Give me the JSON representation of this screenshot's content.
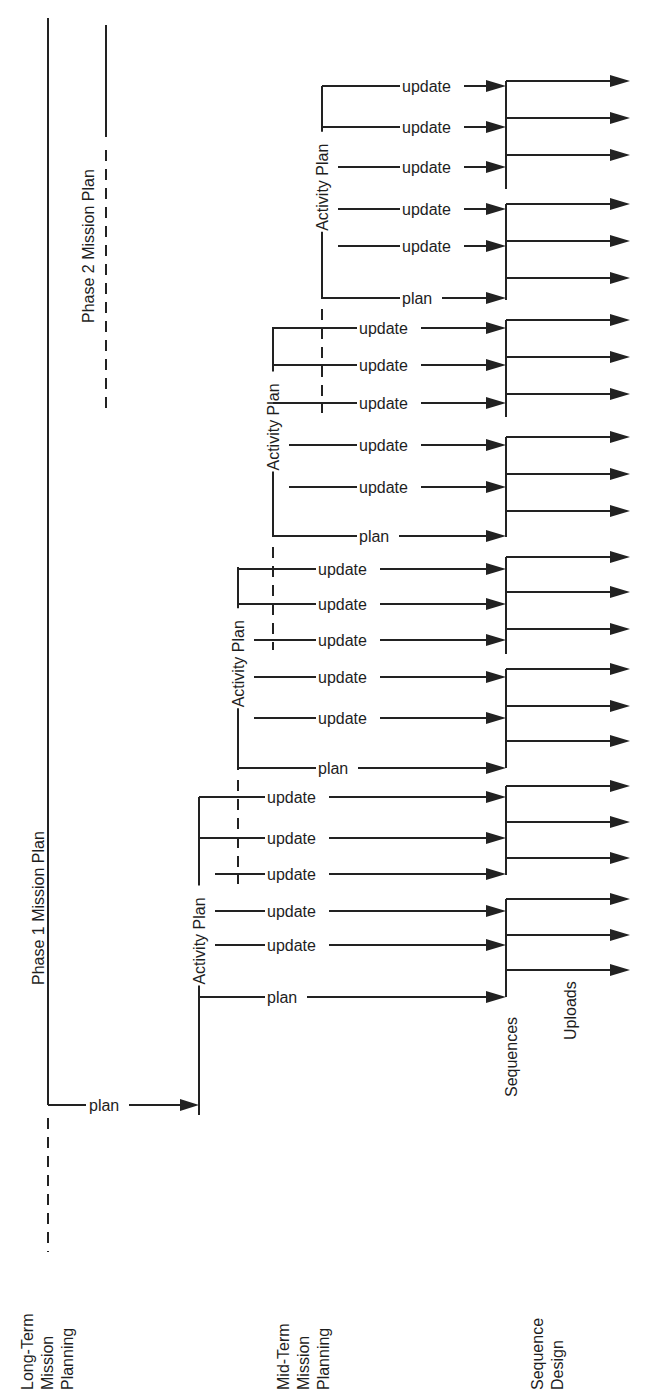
{
  "diagram": {
    "columns": [
      {
        "id": "long-term",
        "lines": [
          "Long-Term",
          "Mission",
          "Planning"
        ]
      },
      {
        "id": "mid-term",
        "lines": [
          "Mid-Term",
          "Mission",
          "Planning"
        ]
      },
      {
        "id": "sequence",
        "lines": [
          "Sequence",
          "Design"
        ]
      }
    ],
    "phase_labels": {
      "phase1": "Phase 1 Mission Plan",
      "phase2": "Phase 2 Mission Plan"
    },
    "long_term_plan_label": "plan",
    "activity_plan_label": "Activity Plan",
    "sequences_label": "Sequences",
    "uploads_label": "Uploads",
    "activity_groups": [
      {
        "x": 199,
        "top": 797,
        "bottom": 1105,
        "dash_bottom": true,
        "rows": [
          {
            "y": 797,
            "label": "update",
            "from_bracket": true
          },
          {
            "y": 838,
            "label": "update",
            "from_bracket": true
          },
          {
            "y": 874,
            "label": "update",
            "from_bracket": false
          },
          {
            "y": 911,
            "label": "update",
            "from_bracket": false
          },
          {
            "y": 945,
            "label": "update",
            "from_bracket": false
          },
          {
            "y": 997,
            "label": "plan",
            "from_bracket": true
          }
        ]
      },
      {
        "x": 238,
        "top": 567,
        "bottom": 770,
        "rows": [
          {
            "y": 569,
            "label": "update",
            "from_bracket": true
          },
          {
            "y": 604,
            "label": "update",
            "from_bracket": true
          },
          {
            "y": 640,
            "label": "update",
            "from_bracket": false
          },
          {
            "y": 677,
            "label": "update",
            "from_bracket": false
          },
          {
            "y": 718,
            "label": "update",
            "from_bracket": false
          },
          {
            "y": 768,
            "label": "plan",
            "from_bracket": true
          }
        ]
      },
      {
        "x": 273,
        "top": 327,
        "bottom": 537,
        "rows": [
          {
            "y": 328,
            "label": "update",
            "from_bracket": true
          },
          {
            "y": 365,
            "label": "update",
            "from_bracket": true
          },
          {
            "y": 403,
            "label": "update",
            "from_bracket": true
          },
          {
            "y": 445,
            "label": "update",
            "from_bracket": false
          },
          {
            "y": 487,
            "label": "update",
            "from_bracket": false
          },
          {
            "y": 536,
            "label": "plan",
            "from_bracket": true
          }
        ]
      },
      {
        "x": 322,
        "top": 86,
        "bottom": 299,
        "rows": [
          {
            "y": 86,
            "label": "update",
            "from_bracket": true
          },
          {
            "y": 127,
            "label": "update",
            "from_bracket": true
          },
          {
            "y": 167,
            "label": "update",
            "from_bracket": false
          },
          {
            "y": 209,
            "label": "update",
            "from_bracket": false
          },
          {
            "y": 246,
            "label": "update",
            "from_bracket": false
          },
          {
            "y": 298,
            "label": "plan",
            "from_bracket": true
          }
        ]
      }
    ],
    "sequence_blocks": [
      {
        "top": 81,
        "bottom": 189,
        "outputs": [
          81,
          118,
          155
        ]
      },
      {
        "top": 204,
        "bottom": 300,
        "outputs": [
          204,
          241,
          278
        ]
      },
      {
        "top": 320,
        "bottom": 417,
        "outputs": [
          320,
          357,
          394
        ]
      },
      {
        "top": 437,
        "bottom": 537,
        "outputs": [
          437,
          474,
          511
        ]
      },
      {
        "top": 557,
        "bottom": 654,
        "outputs": [
          557,
          592,
          629
        ]
      },
      {
        "top": 669,
        "bottom": 768,
        "outputs": [
          669,
          706,
          741
        ]
      },
      {
        "top": 786,
        "bottom": 875,
        "outputs": [
          786,
          822,
          858
        ]
      },
      {
        "top": 899,
        "bottom": 997,
        "outputs": [
          899,
          935,
          970
        ]
      }
    ],
    "colors": {
      "line": "#222222",
      "text": "#1e1e1e",
      "background": "#ffffff"
    }
  }
}
